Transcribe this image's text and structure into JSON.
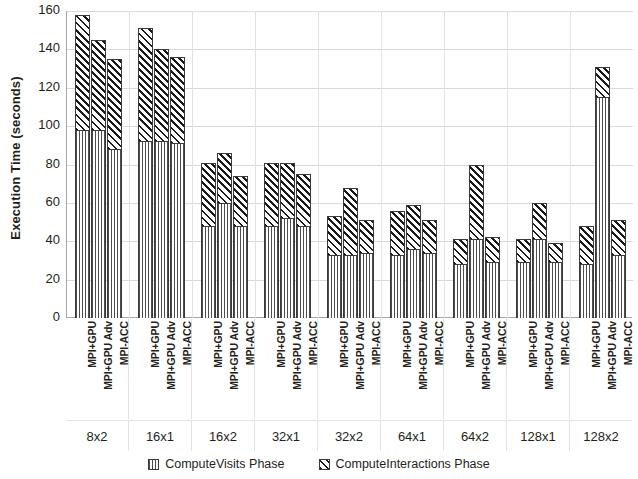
{
  "chart_data": {
    "type": "bar",
    "stacked": true,
    "title": "",
    "xlabel": "",
    "ylabel": "Execution Time (seconds)",
    "ylim": [
      0,
      160
    ],
    "ytick_step": 20,
    "yticks": [
      "0",
      "20",
      "40",
      "60",
      "80",
      "100",
      "120",
      "140",
      "160"
    ],
    "grid": true,
    "legend_position": "bottom",
    "legend": [
      "ComputeVisits Phase",
      "ComputeInteractions Phase"
    ],
    "categories": [
      "8x2",
      "16x1",
      "16x2",
      "32x1",
      "32x2",
      "64x1",
      "64x2",
      "128x1",
      "128x2"
    ],
    "subcategories": [
      "MPI+GPU",
      "MPI+GPU Adv",
      "MPI-ACC"
    ],
    "series": [
      {
        "name": "ComputeVisits Phase",
        "pattern": "vertical-stripes",
        "values": [
          [
            98,
            98,
            88
          ],
          [
            92,
            92,
            91
          ],
          [
            48,
            60,
            48
          ],
          [
            48,
            52,
            48
          ],
          [
            33,
            33,
            34
          ],
          [
            33,
            36,
            34
          ],
          [
            28,
            41,
            29
          ],
          [
            29,
            41,
            29
          ],
          [
            28,
            115,
            33
          ]
        ]
      },
      {
        "name": "ComputeInteractions Phase",
        "pattern": "diagonal-hatch",
        "values": [
          [
            60,
            47,
            47
          ],
          [
            59,
            48,
            45
          ],
          [
            33,
            26,
            26
          ],
          [
            33,
            29,
            27
          ],
          [
            20,
            35,
            17
          ],
          [
            23,
            23,
            17
          ],
          [
            13,
            39,
            13
          ],
          [
            12,
            19,
            10
          ],
          [
            20,
            16,
            18
          ]
        ]
      }
    ],
    "totals": [
      [
        158,
        145,
        135
      ],
      [
        151,
        140,
        136
      ],
      [
        81,
        86,
        74
      ],
      [
        81,
        81,
        75
      ],
      [
        53,
        68,
        51
      ],
      [
        56,
        59,
        51
      ],
      [
        41,
        80,
        42
      ],
      [
        41,
        60,
        39
      ],
      [
        48,
        131,
        51
      ]
    ]
  },
  "colors": {
    "axis": "#a6a6a6",
    "gridline": "#d9d9d9",
    "bar_outline": "#3a3a3a",
    "visits_stripe": "#4d4d4d",
    "interactions_hatch": "#1a1a1a",
    "text": "#231f20",
    "background": "#ffffff"
  }
}
